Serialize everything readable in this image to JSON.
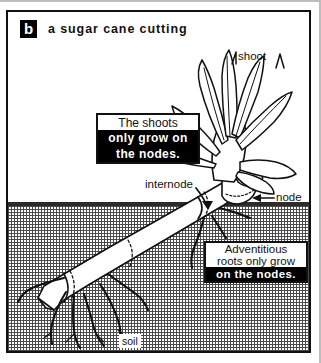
{
  "figure": {
    "panel_letter": "b",
    "title": "a sugar cane cutting"
  },
  "labels": {
    "shoot": "shoot",
    "internode": "internode",
    "node": "node",
    "soil": "soil"
  },
  "callouts": {
    "shoots": {
      "line1": "The shoots",
      "line2": "only grow on",
      "line3": "the nodes."
    },
    "roots": {
      "line1": "Adventitious",
      "line2": "roots only grow",
      "line3": "on the nodes."
    }
  },
  "colors": {
    "ink": "#111111",
    "paper": "#ffffff",
    "soil_hatch": "#4a4a4a",
    "soil_band": "#2b2b2b",
    "highlight_bg": "#000000",
    "highlight_fg": "#ffffff"
  }
}
